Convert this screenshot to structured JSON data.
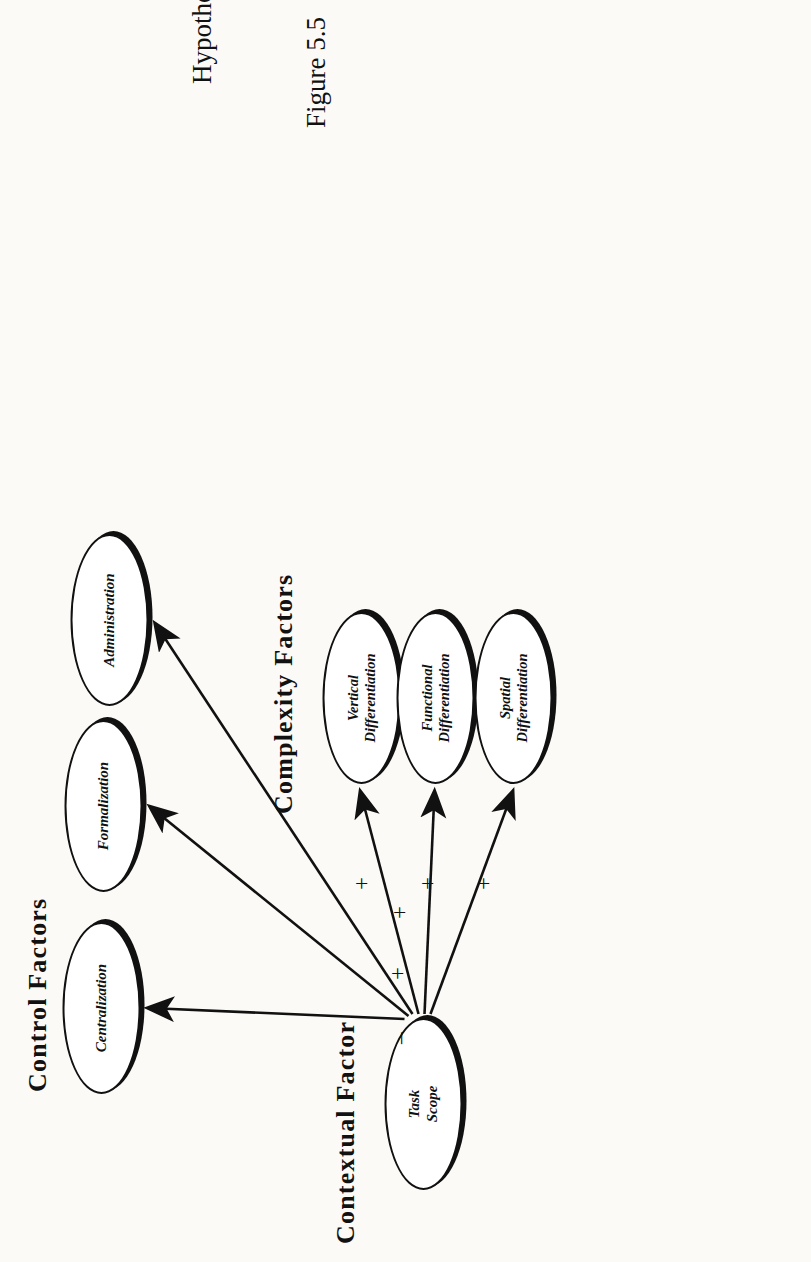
{
  "figure": {
    "caption_number": "Figure 5.5",
    "caption_title": "Hypothesized Direct Effects of Task Scope",
    "orientation": "rotated-90-ccw",
    "ink_color": "#111111",
    "paper_color": "#fbfaf7"
  },
  "groups": {
    "contextual": {
      "heading": "Contextual Factor"
    },
    "complexity": {
      "heading": "Complexity Factors"
    },
    "control": {
      "heading": "Control Factors"
    }
  },
  "nodes": {
    "source": {
      "label_line1": "Task",
      "label_line2": "Scope"
    },
    "complexity": [
      {
        "label_line1": "Vertical",
        "label_line2": "Differentiation"
      },
      {
        "label_line1": "Functional",
        "label_line2": "Differentiation"
      },
      {
        "label_line1": "Spatial",
        "label_line2": "Differentiation"
      }
    ],
    "control": [
      {
        "label_line1": "Centralization",
        "label_line2": ""
      },
      {
        "label_line1": "Formalization",
        "label_line2": ""
      },
      {
        "label_line1": "Administration",
        "label_line2": ""
      }
    ]
  },
  "edges": [
    {
      "from": "Task Scope",
      "to": "Vertical Differentiation",
      "sign": "+"
    },
    {
      "from": "Task Scope",
      "to": "Functional Differentiation",
      "sign": "+"
    },
    {
      "from": "Task Scope",
      "to": "Spatial Differentiation",
      "sign": "+"
    },
    {
      "from": "Task Scope",
      "to": "Centralization",
      "sign": "–"
    },
    {
      "from": "Task Scope",
      "to": "Formalization",
      "sign": "+"
    },
    {
      "from": "Task Scope",
      "to": "Administration",
      "sign": "+"
    }
  ]
}
